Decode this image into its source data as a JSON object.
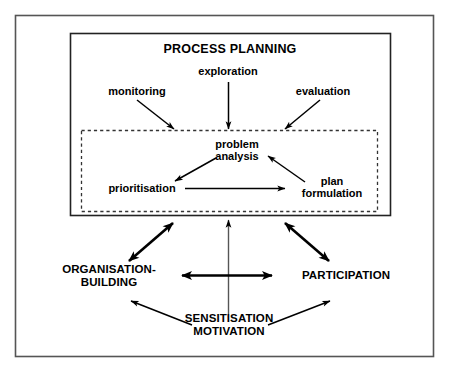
{
  "diagram": {
    "title": "PROCESS PLANNING",
    "outer_frame": {
      "name": "outer-border"
    },
    "process_box": {
      "name": "process-planning-box"
    },
    "dashed_box": {
      "name": "problem-analysis-cycle-box"
    },
    "inputs": [
      {
        "id": "monitoring",
        "label": "monitoring"
      },
      {
        "id": "exploration",
        "label": "exploration"
      },
      {
        "id": "evaluation",
        "label": "evaluation"
      }
    ],
    "cycle_nodes": [
      {
        "id": "problem-analysis",
        "label": "problem\nanalysis"
      },
      {
        "id": "prioritisation",
        "label": "prioritisation"
      },
      {
        "id": "plan-formulation",
        "label": "plan\nformulation"
      }
    ],
    "pillars": [
      {
        "id": "organisation-building",
        "label": "ORGANISATION-\nBUILDING"
      },
      {
        "id": "participation",
        "label": "PARTICIPATION"
      },
      {
        "id": "sensitisation-motivation",
        "label": "SENSITISATION\nMOTIVATION"
      }
    ],
    "colors": {
      "line": "#000000",
      "frame": "#444444",
      "background": "#ffffff",
      "text": "#000000"
    }
  }
}
